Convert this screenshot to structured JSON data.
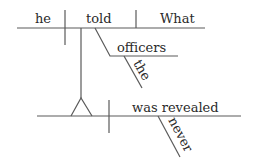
{
  "diagram": {
    "type": "sentence-diagram (Reed-Kellogg)",
    "main_clause": {
      "subject": "he",
      "verb": "told",
      "direct_object": "What",
      "indirect_object": "officers",
      "indirect_object_modifier": "the"
    },
    "subordinate_clause": {
      "subject_placeholder": "",
      "verb": "was revealed",
      "adverb": "never"
    },
    "colors": {
      "line": "#5a5a5a",
      "text": "#2a2a2a",
      "background": "#ffffff"
    }
  }
}
